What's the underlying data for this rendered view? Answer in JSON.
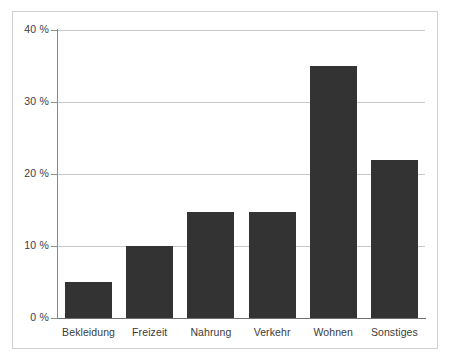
{
  "chart_data": {
    "type": "bar",
    "title": "",
    "subtitle": "",
    "xlabel": "",
    "ylabel": "",
    "categories": [
      "Bekleidung",
      "Freizeit",
      "Nahrung",
      "Verkehr",
      "Wohnen",
      "Sonstiges"
    ],
    "values": [
      5,
      10,
      14.7,
      14.7,
      35,
      22
    ],
    "ylim": [
      0,
      40
    ],
    "y_ticks": [
      0,
      10,
      20,
      30,
      40
    ],
    "y_tick_labels": [
      "0 %",
      "10 %",
      "20 %",
      "30 %",
      "40 %"
    ],
    "grid": true,
    "legend": false,
    "series": [
      {
        "name": "",
        "values": [
          5,
          10,
          14.7,
          14.7,
          35,
          22
        ]
      }
    ],
    "colors": {
      "bar": "#333333",
      "gridline": "#c8c8c8",
      "axis": "#8a8a8a",
      "text": "#3b3b3b",
      "frame": "#d0d0d0",
      "background": "#ffffff"
    }
  }
}
